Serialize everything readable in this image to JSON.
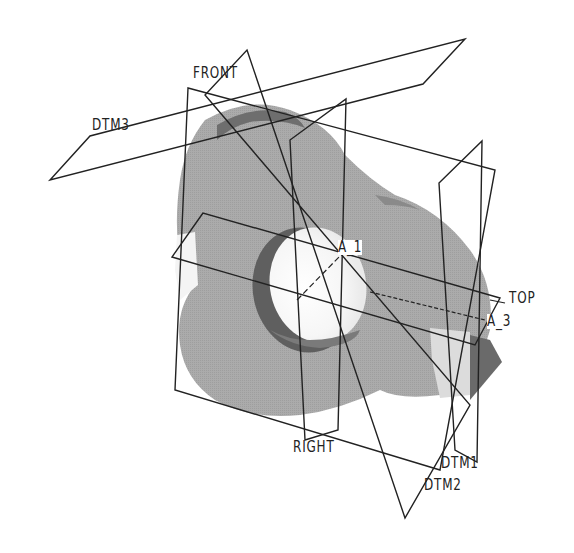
{
  "viewport": {
    "background": "#ffffff",
    "model_color": "#a8a8a8",
    "model_shadow_color": "#6e6e6e",
    "line_color": "#222222"
  },
  "datum_planes": [
    {
      "label": "FRONT",
      "x": 193,
      "y": 65
    },
    {
      "label": "DTM3",
      "x": 92,
      "y": 117
    },
    {
      "label": "TOP",
      "x": 509,
      "y": 290
    },
    {
      "label": "RIGHT",
      "x": 293,
      "y": 440
    },
    {
      "label": "DTM1",
      "x": 441,
      "y": 455
    },
    {
      "label": "DTM2",
      "x": 424,
      "y": 477
    }
  ],
  "axes": [
    {
      "label": "A_1",
      "x": 338,
      "y": 240
    },
    {
      "label": "A_3",
      "x": 487,
      "y": 314
    }
  ]
}
